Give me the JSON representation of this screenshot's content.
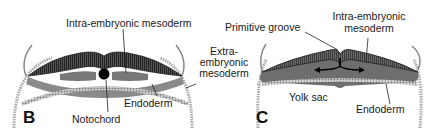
{
  "figure": {
    "panels": [
      {
        "id": "B",
        "letter": "B",
        "labels": {
          "intra_embryonic_mesoderm": "Intra-embryonic mesoderm",
          "notochord": "Notochord",
          "endoderm": "Endoderm"
        }
      },
      {
        "id": "C",
        "letter": "C",
        "labels": {
          "primitive_groove": "Primitive groove",
          "intra_embryonic_mesoderm_line1": "Intra-embryonic",
          "intra_embryonic_mesoderm_line2": "mesoderm",
          "yolk_sac": "Yolk sac",
          "endoderm": "Endoderm"
        }
      }
    ],
    "shared_labels": {
      "extra_embryonic_line1": "Extra-",
      "extra_embryonic_line2": "embryonic",
      "extra_embryonic_line3": "mesoderm"
    },
    "colors": {
      "ectoderm_dark": "#3a3a3a",
      "mesoderm_gray": "#7a7a7a",
      "endoderm_light": "#b5b5b5",
      "notochord": "#000000",
      "leader_line": "#222222"
    }
  }
}
